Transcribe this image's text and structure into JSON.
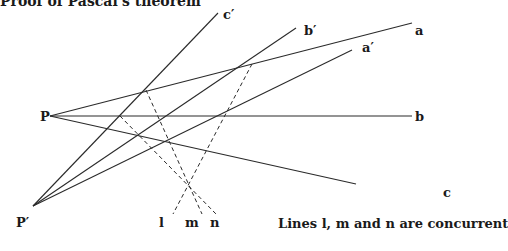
{
  "title": "Proof of Pascal's theorem",
  "caption": "Lines l, m and n are concurrent",
  "points": {
    "P": {
      "label": "P",
      "x": 50,
      "y": 116
    },
    "P_prime": {
      "label": "P′",
      "x": 33,
      "y": 206
    }
  },
  "labels": {
    "a": "a",
    "b": "b",
    "c": "c",
    "a_prime": "a′",
    "b_prime": "b′",
    "c_prime": "c′",
    "l": "l",
    "m": "m",
    "n": "n"
  },
  "colors": {
    "line": "#2a2a2a",
    "text": "#1a1a1a",
    "background": "#ffffff"
  }
}
